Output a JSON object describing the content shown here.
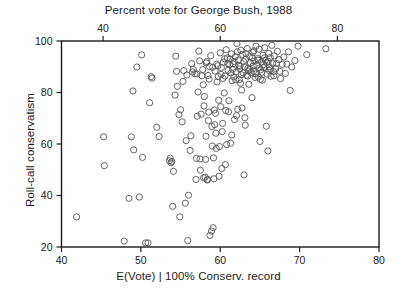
{
  "figure": {
    "title": "Percent vote for George Bush, 1988",
    "xlabel_bottom": "E(Vote) | 100% Conserv. record",
    "ylabel": "Roll-call conservatism"
  },
  "chart_data": {
    "type": "scatter",
    "title": "Percent vote for George Bush, 1988",
    "xlabel": "E(Vote) | 100% Conserv. record",
    "ylabel": "Roll-call conservatism",
    "xlim": [
      40,
      80
    ],
    "ylim": [
      20,
      100
    ],
    "grid": false,
    "legend": null,
    "marker": "open-circle",
    "marker_color": "#555555",
    "x_ticks_bottom": [
      40,
      50,
      60,
      70,
      80
    ],
    "x_ticks_top": [
      40,
      60,
      80
    ],
    "x_top_axis_label": "Percent vote for George Bush, 1988",
    "x_top_lim": [
      32.9,
      87.1
    ],
    "y_ticks": [
      20,
      40,
      60,
      80,
      100
    ],
    "points": [
      [
        41.9,
        31.7
      ],
      [
        45.3,
        62.8
      ],
      [
        45.4,
        51.6
      ],
      [
        47.9,
        22.3
      ],
      [
        48.5,
        38.9
      ],
      [
        48.8,
        62.8
      ],
      [
        49.0,
        80.6
      ],
      [
        49.1,
        57.7
      ],
      [
        49.5,
        89.9
      ],
      [
        49.8,
        39.4
      ],
      [
        50.1,
        94.6
      ],
      [
        50.2,
        54.8
      ],
      [
        50.6,
        21.6
      ],
      [
        50.9,
        21.6
      ],
      [
        51.1,
        76.0
      ],
      [
        51.3,
        86.2
      ],
      [
        51.4,
        85.6
      ],
      [
        52.0,
        66.5
      ],
      [
        52.3,
        62.9
      ],
      [
        53.6,
        53.5
      ],
      [
        53.7,
        54.5
      ],
      [
        53.8,
        52.7
      ],
      [
        53.9,
        53.2
      ],
      [
        54.0,
        35.8
      ],
      [
        54.1,
        49.4
      ],
      [
        54.3,
        79.0
      ],
      [
        54.4,
        94.1
      ],
      [
        54.5,
        88.2
      ],
      [
        54.6,
        82.4
      ],
      [
        54.8,
        71.4
      ],
      [
        54.9,
        31.7
      ],
      [
        55.0,
        73.3
      ],
      [
        55.2,
        68.6
      ],
      [
        55.3,
        84.3
      ],
      [
        55.4,
        88.5
      ],
      [
        55.6,
        37.0
      ],
      [
        55.7,
        61.3
      ],
      [
        55.8,
        86.8
      ],
      [
        55.9,
        22.5
      ],
      [
        56.0,
        40.1
      ],
      [
        56.2,
        57.5
      ],
      [
        56.3,
        63.2
      ],
      [
        56.4,
        91.2
      ],
      [
        56.6,
        89.0
      ],
      [
        56.8,
        87.3
      ],
      [
        57.0,
        54.4
      ],
      [
        57.1,
        70.8
      ],
      [
        57.2,
        80.2
      ],
      [
        57.3,
        96.1
      ],
      [
        57.4,
        92.3
      ],
      [
        57.5,
        49.8
      ],
      [
        57.6,
        71.6
      ],
      [
        57.7,
        86.5
      ],
      [
        57.8,
        88.9
      ],
      [
        57.9,
        46.9
      ],
      [
        58.0,
        78.4
      ],
      [
        58.1,
        47.1
      ],
      [
        58.2,
        63.0
      ],
      [
        58.3,
        92.0
      ],
      [
        58.4,
        46.3
      ],
      [
        58.5,
        69.1
      ],
      [
        58.6,
        85.2
      ],
      [
        58.7,
        24.5
      ],
      [
        58.8,
        94.3
      ],
      [
        58.9,
        26.2
      ],
      [
        59.0,
        59.2
      ],
      [
        59.1,
        27.5
      ],
      [
        59.2,
        46.5
      ],
      [
        59.3,
        67.5
      ],
      [
        59.4,
        71.9
      ],
      [
        59.5,
        58.3
      ],
      [
        59.6,
        84.1
      ],
      [
        59.7,
        90.4
      ],
      [
        59.8,
        77.0
      ],
      [
        59.9,
        59.0
      ],
      [
        60.0,
        95.4
      ],
      [
        60.1,
        87.0
      ],
      [
        60.2,
        50.5
      ],
      [
        60.3,
        68.0
      ],
      [
        60.4,
        91.8
      ],
      [
        60.5,
        79.8
      ],
      [
        60.6,
        86.4
      ],
      [
        60.7,
        73.0
      ],
      [
        60.8,
        59.8
      ],
      [
        60.9,
        93.4
      ],
      [
        61.0,
        88.6
      ],
      [
        61.1,
        76.8
      ],
      [
        61.2,
        90.8
      ],
      [
        61.3,
        60.3
      ],
      [
        61.4,
        95.0
      ],
      [
        61.5,
        84.6
      ],
      [
        61.6,
        91.1
      ],
      [
        61.7,
        86.1
      ],
      [
        61.8,
        69.5
      ],
      [
        61.9,
        93.9
      ],
      [
        62.0,
        88.0
      ],
      [
        62.1,
        99.0
      ],
      [
        62.2,
        73.5
      ],
      [
        62.3,
        92.6
      ],
      [
        62.4,
        85.0
      ],
      [
        62.5,
        90.2
      ],
      [
        62.6,
        96.4
      ],
      [
        62.7,
        81.0
      ],
      [
        62.8,
        94.8
      ],
      [
        62.9,
        87.6
      ],
      [
        63.0,
        48.0
      ],
      [
        63.1,
        70.2
      ],
      [
        63.2,
        92.9
      ],
      [
        63.3,
        86.7
      ],
      [
        63.4,
        97.1
      ],
      [
        63.5,
        89.4
      ],
      [
        63.6,
        83.2
      ],
      [
        63.7,
        94.0
      ],
      [
        63.8,
        91.5
      ],
      [
        63.9,
        87.8
      ],
      [
        64.0,
        78.0
      ],
      [
        64.1,
        95.6
      ],
      [
        64.2,
        88.3
      ],
      [
        64.3,
        92.2
      ],
      [
        64.4,
        85.8
      ],
      [
        64.5,
        98.0
      ],
      [
        64.6,
        90.6
      ],
      [
        64.7,
        93.2
      ],
      [
        64.8,
        86.0
      ],
      [
        64.9,
        96.8
      ],
      [
        65.0,
        61.0
      ],
      [
        65.1,
        88.8
      ],
      [
        65.2,
        91.9
      ],
      [
        65.3,
        84.8
      ],
      [
        65.4,
        94.5
      ],
      [
        65.5,
        89.7
      ],
      [
        65.6,
        97.4
      ],
      [
        65.7,
        92.5
      ],
      [
        65.8,
        66.9
      ],
      [
        65.9,
        87.1
      ],
      [
        66.0,
        57.3
      ],
      [
        66.1,
        95.2
      ],
      [
        66.2,
        90.0
      ],
      [
        66.3,
        93.6
      ],
      [
        66.4,
        86.3
      ],
      [
        66.5,
        98.3
      ],
      [
        66.6,
        91.4
      ],
      [
        66.7,
        88.1
      ],
      [
        66.8,
        94.2
      ],
      [
        67.0,
        89.3
      ],
      [
        67.2,
        96.0
      ],
      [
        67.4,
        92.8
      ],
      [
        67.6,
        85.4
      ],
      [
        67.8,
        90.9
      ],
      [
        68.0,
        93.8
      ],
      [
        68.2,
        87.4
      ],
      [
        68.4,
        91.0
      ],
      [
        68.6,
        95.8
      ],
      [
        68.8,
        80.8
      ],
      [
        69.0,
        89.9
      ],
      [
        69.4,
        92.4
      ],
      [
        69.8,
        98.0
      ],
      [
        70.9,
        94.7
      ],
      [
        73.3,
        97.0
      ],
      [
        56.5,
        88.0
      ],
      [
        57.05,
        87.2
      ],
      [
        58.45,
        86.6
      ],
      [
        59.35,
        88.3
      ],
      [
        60.15,
        89.6
      ],
      [
        60.95,
        91.2
      ],
      [
        61.55,
        89.0
      ],
      [
        62.35,
        90.5
      ],
      [
        62.95,
        92.0
      ],
      [
        63.55,
        88.4
      ],
      [
        64.15,
        90.3
      ],
      [
        64.75,
        92.6
      ],
      [
        65.25,
        87.9
      ],
      [
        65.85,
        91.6
      ],
      [
        66.35,
        89.1
      ],
      [
        61.25,
        93.0
      ],
      [
        62.65,
        86.9
      ],
      [
        63.25,
        95.1
      ],
      [
        64.45,
        87.2
      ],
      [
        65.55,
        93.4
      ],
      [
        59.75,
        86.2
      ],
      [
        60.55,
        93.1
      ],
      [
        61.95,
        84.9
      ],
      [
        63.05,
        90.0
      ],
      [
        64.05,
        93.5
      ],
      [
        64.95,
        89.5
      ],
      [
        66.05,
        92.1
      ],
      [
        62.15,
        95.8
      ],
      [
        59.55,
        91.0
      ],
      [
        60.35,
        85.5
      ],
      [
        61.35,
        87.6
      ],
      [
        62.45,
        89.2
      ],
      [
        63.45,
        86.4
      ],
      [
        64.25,
        96.2
      ],
      [
        65.05,
        85.1
      ],
      [
        66.15,
        88.6
      ],
      [
        58.25,
        91.5
      ],
      [
        59.05,
        89.8
      ],
      [
        57.85,
        83.0
      ],
      [
        58.65,
        90.1
      ],
      [
        60.75,
        96.6
      ],
      [
        61.75,
        92.1
      ],
      [
        62.55,
        83.6
      ],
      [
        63.75,
        89.0
      ],
      [
        65.45,
        90.8
      ],
      [
        66.75,
        86.5
      ],
      [
        67.1,
        91.3
      ],
      [
        67.5,
        88.2
      ],
      [
        60.05,
        74.5
      ],
      [
        61.05,
        72.5
      ],
      [
        62.05,
        71.0
      ],
      [
        62.75,
        74.0
      ],
      [
        59.25,
        73.2
      ],
      [
        58.95,
        66.8
      ],
      [
        60.25,
        64.8
      ],
      [
        61.45,
        63.5
      ],
      [
        63.15,
        67.3
      ],
      [
        59.45,
        64.2
      ],
      [
        58.55,
        72.4
      ],
      [
        57.95,
        74.8
      ],
      [
        59.85,
        47.5
      ],
      [
        60.65,
        52.0
      ],
      [
        58.15,
        54.0
      ],
      [
        57.45,
        54.2
      ],
      [
        56.95,
        46.2
      ],
      [
        59.15,
        54.6
      ],
      [
        58.35,
        46.0
      ]
    ]
  }
}
